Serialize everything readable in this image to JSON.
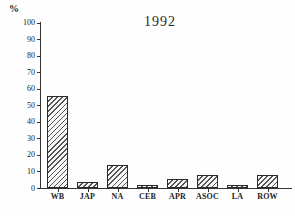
{
  "figure": {
    "unit_label": "%",
    "title": "1992"
  },
  "chart_data": {
    "type": "bar",
    "title": "1992",
    "xlabel": "",
    "ylabel": "%",
    "categories": [
      "WB",
      "JAP",
      "NA",
      "CEB",
      "APR",
      "ASOC",
      "LA",
      "ROW"
    ],
    "values": [
      56,
      4,
      14,
      2,
      6,
      8,
      2,
      8
    ],
    "ylim": [
      0,
      100
    ],
    "ytick_step": 10,
    "ytick_labels": [
      "0",
      "10",
      "20",
      "30",
      "40",
      "50",
      "60",
      "70",
      "80",
      "90",
      "100"
    ],
    "grid": false,
    "legend": null,
    "bar_style": "diagonal-hatch",
    "colors": {
      "ink": "#1a1a1a",
      "axis": "#333333",
      "hatch": "#555555",
      "background": "#fefefe"
    }
  }
}
